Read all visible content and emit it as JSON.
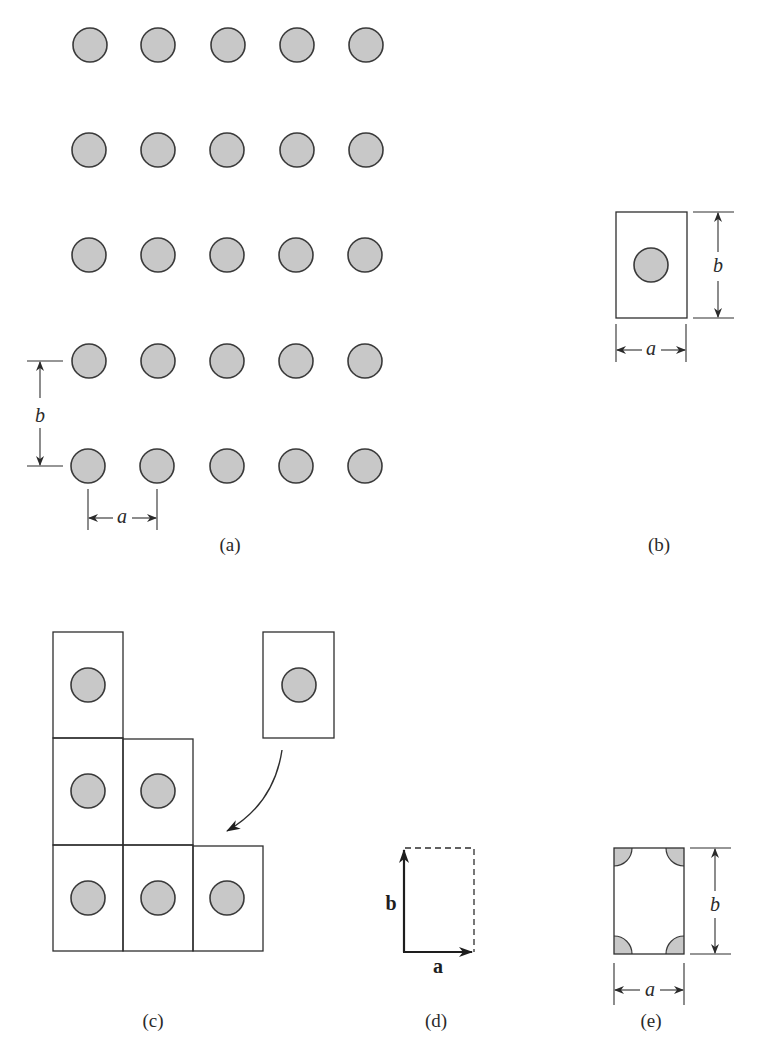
{
  "figure": {
    "colors": {
      "atom_fill": "#c8c8c8",
      "stroke": "#2e2e2e",
      "background": "#ffffff"
    },
    "panels": {
      "a": {
        "caption": "(a)",
        "lattice_rows": 5,
        "lattice_cols": 5,
        "dim_horizontal_label": "a",
        "dim_vertical_label": "b"
      },
      "b": {
        "caption": "(b)",
        "dim_horizontal_label": "a",
        "dim_vertical_label": "b"
      },
      "c": {
        "caption": "(c)",
        "cells_per_row": [
          1,
          2,
          3
        ],
        "loose_cell": "cell being placed, indicated by curved arrow"
      },
      "d": {
        "caption": "(d)",
        "vector_a_label": "a",
        "vector_b_label": "b"
      },
      "e": {
        "caption": "(e)",
        "dim_horizontal_label": "a",
        "dim_vertical_label": "b",
        "corner_atoms": 4
      }
    }
  }
}
